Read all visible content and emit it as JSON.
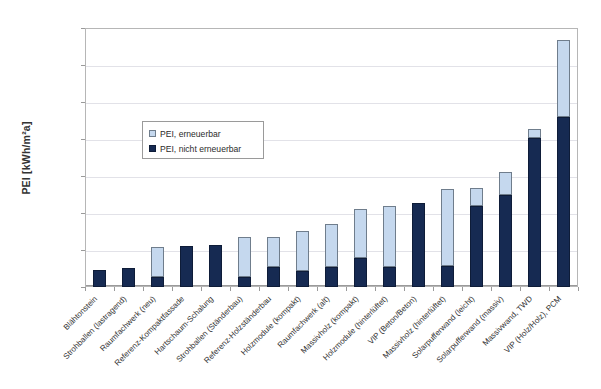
{
  "chart_data": {
    "type": "bar",
    "stacked": true,
    "title": "",
    "xlabel": "",
    "ylabel": "PEI [kWh/m²a]",
    "ylim": [
      0,
      35
    ],
    "yticks": [
      "0.00",
      "5.00",
      "10.00",
      "15.00",
      "20.00",
      "25.00",
      "30.00",
      "35.00"
    ],
    "ytick_values": [
      0,
      5,
      10,
      15,
      20,
      25,
      30,
      35
    ],
    "grid": true,
    "legend_position": "inside-upper-left",
    "legend": [
      "PEI, erneuerbar",
      "PEI, nicht erneuerbar"
    ],
    "categories": [
      "Blähtonstein",
      "Strohballen (lastragend)",
      "Raumfachwerk (neu)",
      "Referenz-Kompaktfassade",
      "Hartschaum-Schalung",
      "Strohballen (Ständerbau)",
      "Referenz-Holzständerbau",
      "Holzmodule (kompakt)",
      "Raumfachwerk (alt)",
      "Massivholz (kompakt)",
      "Holzmodule (hinterlüftet)",
      "VIP (Beton/Beton)",
      "Massivholz (hinterlüftet)",
      "Solarpufferwand (leicht)",
      "Solarpufferwand (massiv)",
      "Massivwand, TWD",
      "VIP (Holz/Holz), PCM"
    ],
    "series": [
      {
        "name": "PEI, nicht erneuerbar",
        "color": "#162a52",
        "values": [
          2.3,
          2.6,
          1.4,
          5.5,
          5.7,
          1.4,
          2.7,
          2.2,
          2.7,
          3.9,
          2.7,
          11.3,
          2.9,
          10.9,
          12.4,
          20.2,
          23.0
        ]
      },
      {
        "name": "PEI, erneuerbar",
        "color": "#c5d8ee",
        "values": [
          0.0,
          0.0,
          4.0,
          0.0,
          0.0,
          5.3,
          4.0,
          5.4,
          5.8,
          6.6,
          8.2,
          0.0,
          10.3,
          2.5,
          3.1,
          1.1,
          10.4
        ]
      }
    ],
    "totals": [
      2.3,
      2.6,
      5.4,
      5.5,
      5.7,
      6.7,
      6.7,
      7.6,
      8.5,
      10.5,
      10.9,
      11.3,
      13.2,
      13.4,
      15.5,
      21.3,
      33.4
    ]
  }
}
